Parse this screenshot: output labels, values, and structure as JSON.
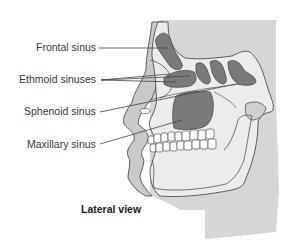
{
  "figure": {
    "caption": "Lateral view",
    "labels": [
      {
        "text": "Frontal sinus",
        "name": "frontal-sinus"
      },
      {
        "text": "Ethmoid sinuses",
        "name": "ethmoid-sinuses"
      },
      {
        "text": "Sphenoid sinus",
        "name": "sphenoid-sinus"
      },
      {
        "text": "Maxillary sinus",
        "name": "maxillary-sinus"
      }
    ],
    "colors": {
      "background_panel": "#d4d4d4",
      "bone": "#ececec",
      "sinus_fill": "#7a7a7a",
      "soft_tissue": "#c8c8c8",
      "outline": "#3c3c3c",
      "leader_line": "#444444"
    }
  }
}
